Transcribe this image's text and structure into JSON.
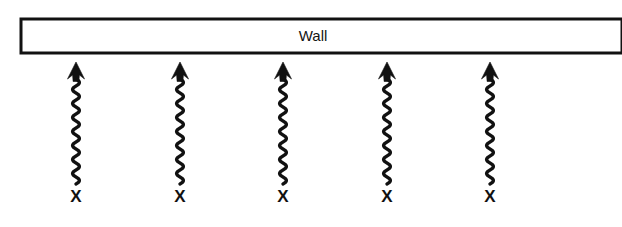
{
  "figure": {
    "background_color": "#ffffff",
    "ink_color": "#111111",
    "width": 622,
    "height": 227
  },
  "wall": {
    "label": "Wall",
    "label_x": 313,
    "label_y": 41,
    "rect": {
      "x": 21,
      "y": 19,
      "width": 601,
      "height": 34
    },
    "stroke_color": "#121212",
    "fill_color": "#ffffff"
  },
  "arrows": [
    {
      "id": "arrow-1",
      "source_label": "X",
      "center_x": 76,
      "tip_y": 62,
      "tail_y": 184,
      "label_y": 202
    },
    {
      "id": "arrow-2",
      "source_label": "X",
      "center_x": 180,
      "tip_y": 62,
      "tail_y": 184,
      "label_y": 202
    },
    {
      "id": "arrow-3",
      "source_label": "X",
      "center_x": 283,
      "tip_y": 62,
      "tail_y": 184,
      "label_y": 202
    },
    {
      "id": "arrow-4",
      "source_label": "X",
      "center_x": 387,
      "tip_y": 62,
      "tail_y": 184,
      "label_y": 202
    },
    {
      "id": "arrow-5",
      "source_label": "X",
      "center_x": 490,
      "tip_y": 62,
      "tail_y": 184,
      "label_y": 202
    }
  ],
  "wave": {
    "amplitude": 3.4,
    "half_period": 7.0,
    "line_width": 3.4,
    "head_half_width": 8.5,
    "head_height": 17
  }
}
